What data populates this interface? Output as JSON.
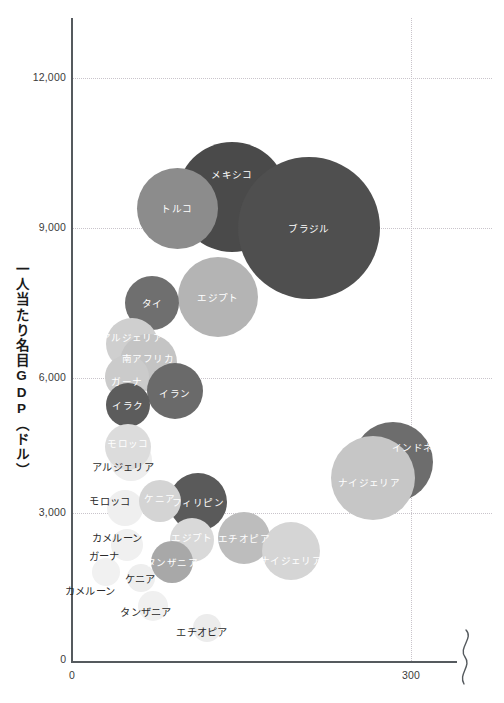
{
  "chart_data": {
    "type": "scatter",
    "title": "",
    "xlabel": "",
    "ylabel": "一人当たり名目GDP（ドル）",
    "xlim": [
      0,
      340
    ],
    "ylim": [
      0,
      13200
    ],
    "x_ticks": [
      "0",
      "300"
    ],
    "y_ticks": [
      "0",
      "3,000",
      "6,000",
      "9,000",
      "12,000"
    ],
    "grid": "dotted",
    "legend": "none",
    "axis_break_right": true,
    "note_x_axis_origin": "0",
    "points": [
      {
        "label": "メキシコ",
        "cx": 232,
        "cy": 197,
        "r": 55,
        "color": "#4a4a4a",
        "label_x": 232,
        "label_y": 174,
        "label_class": "dark"
      },
      {
        "label": "ブラジル",
        "cx": 309,
        "cy": 228,
        "r": 71,
        "color": "#4f4f4f",
        "label_x": 309,
        "label_y": 228,
        "label_class": "dark"
      },
      {
        "label": "トルコ",
        "cx": 177,
        "cy": 208,
        "r": 40.5,
        "color": "#8c8c8c",
        "label_x": 177,
        "label_y": 208,
        "label_class": "dark"
      },
      {
        "label": "エジプト",
        "cx": 218,
        "cy": 297,
        "r": 40,
        "color": "#b4b4b4",
        "label_x": 218,
        "label_y": 297,
        "label_class": "onlight"
      },
      {
        "label": "タイ",
        "cx": 152,
        "cy": 303,
        "r": 27,
        "color": "#6f6f6f",
        "label_x": 152,
        "label_y": 303,
        "label_class": "dark"
      },
      {
        "label": "アルジェリア",
        "cx": 132,
        "cy": 344,
        "r": 26,
        "color": "#cfcfcf",
        "label_x": 132,
        "label_y": 337,
        "label_class": "onlight"
      },
      {
        "label": "南アフリカ",
        "cx": 148,
        "cy": 362,
        "r": 28.5,
        "color": "#c4c4c4",
        "label_x": 148,
        "label_y": 358,
        "label_class": "onlight"
      },
      {
        "label": "ガーナ",
        "cx": 127,
        "cy": 377,
        "r": 22,
        "color": "#cbcbcb",
        "label_x": 127,
        "label_y": 381,
        "label_class": "onlight"
      },
      {
        "label": "イラン",
        "cx": 175,
        "cy": 391,
        "r": 28,
        "color": "#6a6a6a",
        "label_x": 175,
        "label_y": 393,
        "label_class": "dark"
      },
      {
        "label": "イラク",
        "cx": 128,
        "cy": 405,
        "r": 22,
        "color": "#5c5c5c",
        "label_x": 128,
        "label_y": 405,
        "label_class": "dark"
      },
      {
        "label": "モロッコ",
        "cx": 128,
        "cy": 447,
        "r": 23,
        "color": "#dcdcdc",
        "label_x": 128,
        "label_y": 443,
        "label_class": "onlight"
      },
      {
        "label": "インドネシア",
        "cx": 393,
        "cy": 462,
        "r": 40,
        "color": "#6d6d6d",
        "label_x": 423,
        "label_y": 447,
        "label_class": "dark"
      },
      {
        "label": "ナイジェリア",
        "cx": 373,
        "cy": 478,
        "r": 42,
        "color": "#c6c6c6",
        "label_x": 369,
        "label_y": 482,
        "label_class": "onlight"
      },
      {
        "label": "フィリピン",
        "cx": 198,
        "cy": 502,
        "r": 29,
        "color": "#5a5a5a",
        "label_x": 198,
        "label_y": 502,
        "label_class": "dark"
      },
      {
        "label": "ケニア",
        "cx": 160,
        "cy": 501,
        "r": 21,
        "color": "#d4d4d4",
        "label_x": 160,
        "label_y": 498,
        "label_class": "onlight"
      },
      {
        "label": "エチオピア",
        "cx": 244,
        "cy": 538,
        "r": 26,
        "color": "#bdbdbd",
        "label_x": 244,
        "label_y": 538,
        "label_class": "onlight"
      },
      {
        "label": "エジプト",
        "cx": 192,
        "cy": 540,
        "r": 22,
        "color": "#d9d9d9",
        "label_x": 192,
        "label_y": 537,
        "label_class": "onlight"
      },
      {
        "label": "ナイジェリア",
        "cx": 291,
        "cy": 551,
        "r": 29,
        "color": "#d5d5d5",
        "label_x": 291,
        "label_y": 560,
        "label_class": "onlight"
      },
      {
        "label": "タンザニア",
        "cx": 172,
        "cy": 562,
        "r": 21,
        "color": "#a8a8a8",
        "label_x": 172,
        "label_y": 562,
        "label_class": "dark"
      }
    ],
    "faint_bubbles": [
      {
        "cx": 131,
        "cy": 460,
        "r": 21,
        "color": "#ededed"
      },
      {
        "cx": 125,
        "cy": 508,
        "r": 18,
        "color": "#efefef"
      },
      {
        "cx": 127,
        "cy": 545,
        "r": 16,
        "color": "#f0f0f0"
      },
      {
        "cx": 106,
        "cy": 572,
        "r": 14,
        "color": "#f1f1f1"
      },
      {
        "cx": 141,
        "cy": 578,
        "r": 14,
        "color": "#eeeeee"
      },
      {
        "cx": 153,
        "cy": 606,
        "r": 15,
        "color": "#f0f0f0"
      },
      {
        "cx": 207,
        "cy": 628,
        "r": 14,
        "color": "#ececec"
      },
      {
        "cx": 183,
        "cy": 488,
        "r": 0,
        "color": "#ffffff"
      }
    ],
    "outside_labels": [
      {
        "text": "アルジェリア",
        "x": 123,
        "y": 466
      },
      {
        "text": "モロッコ",
        "x": 110,
        "y": 500
      },
      {
        "text": "カメルーン",
        "x": 117,
        "y": 537
      },
      {
        "text": "ガーナ",
        "x": 104,
        "y": 555
      },
      {
        "text": "ケニア",
        "x": 140,
        "y": 578
      },
      {
        "text": "カメルーン",
        "x": 90,
        "y": 590
      },
      {
        "text": "タンザニア",
        "x": 146,
        "y": 611
      },
      {
        "text": "エチオピア",
        "x": 202,
        "y": 631
      }
    ]
  },
  "axis": {
    "y_title": "一人当たり名目GDP（ドル）",
    "y_origin": "0",
    "x_origin": "0",
    "x_tick_300": "300",
    "y_tick_3000": "3,000",
    "y_tick_6000": "6,000",
    "y_tick_9000": "9,000",
    "y_tick_12000": "12,000"
  }
}
